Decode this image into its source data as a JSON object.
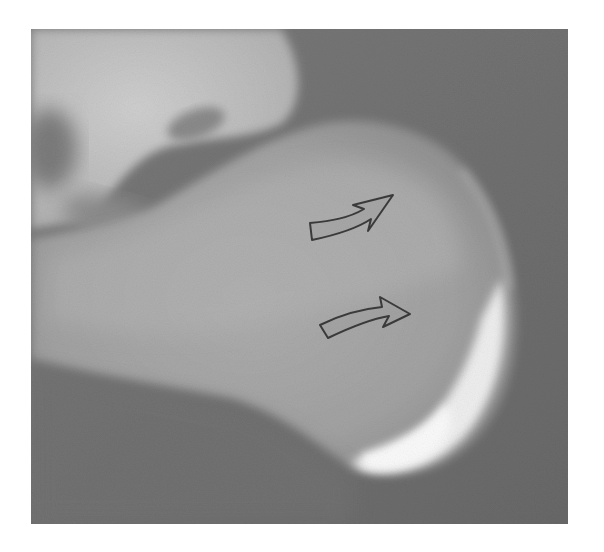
{
  "image": {
    "subject": "lateral heel radiograph (calcaneus)",
    "colors": {
      "background": "#ffffff",
      "soft_tissue": "#6e6e6e",
      "bone_light": "#c4c4c4",
      "bone_mid": "#a6a6a6",
      "cortex_bright": "#f2f2f2",
      "arrow_stroke": "#3a3a3a"
    }
  },
  "annotations": [
    {
      "id": "arrow-upper",
      "type": "curved-arrow",
      "direction": "up-right"
    },
    {
      "id": "arrow-lower",
      "type": "curved-arrow",
      "direction": "up-right"
    }
  ]
}
